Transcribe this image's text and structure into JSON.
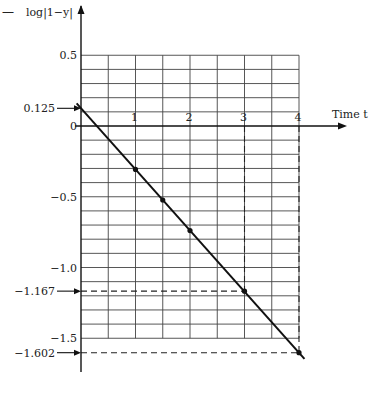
{
  "chart_data": {
    "type": "line",
    "title": "",
    "xlabel": "Time t",
    "ylabel": "log|1−y|",
    "xlim": [
      0,
      4
    ],
    "ylim": [
      -1.5,
      0.5
    ],
    "grid": true,
    "x_ticks": [
      {
        "value": 1,
        "label": "1"
      },
      {
        "value": 2,
        "label": "2"
      },
      {
        "value": 3,
        "label": "3"
      },
      {
        "value": 4,
        "label": "4"
      }
    ],
    "y_ticks": [
      {
        "value": 0.5,
        "label": "0.5"
      },
      {
        "value": 0,
        "label": "0"
      },
      {
        "value": -0.5,
        "label": "−0.5"
      },
      {
        "value": -1.0,
        "label": "−1.0"
      },
      {
        "value": -1.5,
        "label": "−1.5"
      }
    ],
    "annotated_y": [
      {
        "value": 0.125,
        "label": "0.125"
      },
      {
        "value": -1.167,
        "label": "−1.167"
      },
      {
        "value": -1.602,
        "label": "−1.602"
      }
    ],
    "series": [
      {
        "name": "log|1-y| vs t",
        "x": [
          0,
          4
        ],
        "y": [
          0.125,
          -1.602
        ]
      }
    ],
    "points": [
      {
        "x": 1,
        "y": -0.307
      },
      {
        "x": 1.5,
        "y": -0.523
      },
      {
        "x": 2,
        "y": -0.739
      },
      {
        "x": 3,
        "y": -1.167
      },
      {
        "x": 4,
        "y": -1.602
      }
    ],
    "dashed_guides": [
      {
        "x": 3,
        "y": -1.167
      },
      {
        "x": 4,
        "y": -1.602
      }
    ],
    "header_mark": "—"
  }
}
